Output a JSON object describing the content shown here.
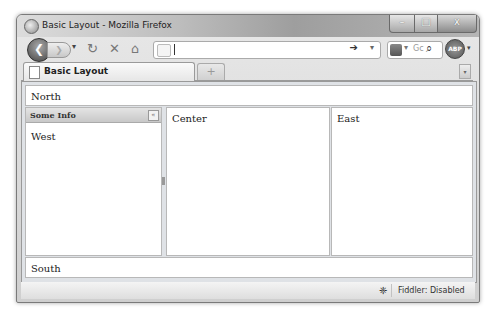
{
  "window": {
    "title": "Basic Layout - Mozilla Firefox",
    "controls": {
      "minimize": "–",
      "maximize": "□",
      "close": "x"
    }
  },
  "navbar": {
    "back_icon": "❮",
    "forward_icon": "❯",
    "dropdown_icon": "▾",
    "reload_icon": "↻",
    "stop_icon": "✕",
    "home_icon": "⌂",
    "url_value": "",
    "go_icon": "➔",
    "url_dropdown_icon": "▾",
    "search_engine_dropdown": "▾",
    "search_placeholder": "Gc",
    "search_icon": "⌕",
    "abp_label": "ABP",
    "abp_dropdown": "▾"
  },
  "tabs": {
    "items": [
      {
        "label": "Basic Layout",
        "active": true
      }
    ],
    "new_tab_icon": "+",
    "tab_list_icon": "▾"
  },
  "layout": {
    "north": "North",
    "west": {
      "header": "Some Info",
      "collapse_icon": "«",
      "body": "West"
    },
    "center": "Center",
    "east": "East",
    "south": "South"
  },
  "statusbar": {
    "fiddler_icon": "❈",
    "fiddler_text": "Fiddler: Disabled"
  }
}
